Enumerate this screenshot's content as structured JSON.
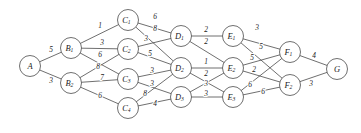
{
  "diagram": {
    "colors": {
      "background": "#ffffff",
      "stroke": "#4a4a4a",
      "text": "#1a1a1a"
    },
    "geometry": {
      "width": 361,
      "height": 133,
      "node_radius": 10.5
    }
  },
  "chart_data": {
    "type": "diagram",
    "layers": [
      [
        "A"
      ],
      [
        "B1",
        "B2"
      ],
      [
        "C1",
        "C2",
        "C3",
        "C4"
      ],
      [
        "D1",
        "D2",
        "D3"
      ],
      [
        "E1",
        "E2",
        "E3"
      ],
      [
        "F1",
        "F2"
      ],
      [
        "G"
      ]
    ],
    "nodes": [
      {
        "id": "A",
        "base": "A",
        "sub": "",
        "x": 30,
        "y": 66
      },
      {
        "id": "B1",
        "base": "B",
        "sub": "1",
        "x": 71,
        "y": 48
      },
      {
        "id": "B2",
        "base": "B",
        "sub": "2",
        "x": 71,
        "y": 83
      },
      {
        "id": "C1",
        "base": "C",
        "sub": "1",
        "x": 128,
        "y": 20
      },
      {
        "id": "C2",
        "base": "C",
        "sub": "2",
        "x": 128,
        "y": 49
      },
      {
        "id": "C3",
        "base": "C",
        "sub": "3",
        "x": 128,
        "y": 79
      },
      {
        "id": "C4",
        "base": "C",
        "sub": "4",
        "x": 128,
        "y": 108
      },
      {
        "id": "D1",
        "base": "D",
        "sub": "1",
        "x": 181,
        "y": 36
      },
      {
        "id": "D2",
        "base": "D",
        "sub": "2",
        "x": 181,
        "y": 68
      },
      {
        "id": "D3",
        "base": "D",
        "sub": "3",
        "x": 181,
        "y": 97
      },
      {
        "id": "E1",
        "base": "E",
        "sub": "1",
        "x": 233,
        "y": 36
      },
      {
        "id": "E2",
        "base": "E",
        "sub": "2",
        "x": 233,
        "y": 68
      },
      {
        "id": "E3",
        "base": "E",
        "sub": "3",
        "x": 233,
        "y": 97
      },
      {
        "id": "F1",
        "base": "F",
        "sub": "1",
        "x": 290,
        "y": 52
      },
      {
        "id": "F2",
        "base": "F",
        "sub": "2",
        "x": 290,
        "y": 85
      },
      {
        "id": "G",
        "base": "G",
        "sub": "",
        "x": 337,
        "y": 69
      }
    ],
    "edges": [
      {
        "from": "A",
        "to": "B1",
        "weight": 5,
        "lx": 51,
        "ly": 49
      },
      {
        "from": "A",
        "to": "B2",
        "weight": 3,
        "lx": 51,
        "ly": 80
      },
      {
        "from": "B1",
        "to": "C1",
        "weight": 1,
        "lx": 100,
        "ly": 25
      },
      {
        "from": "B1",
        "to": "C2",
        "weight": 3,
        "lx": 102,
        "ly": 42
      },
      {
        "from": "B1",
        "to": "C3",
        "weight": 6,
        "lx": 100,
        "ly": 54
      },
      {
        "from": "B2",
        "to": "C2",
        "weight": 8,
        "lx": 98,
        "ly": 66
      },
      {
        "from": "B2",
        "to": "C3",
        "weight": 7,
        "lx": 102,
        "ly": 77
      },
      {
        "from": "B2",
        "to": "C4",
        "weight": 6,
        "lx": 100,
        "ly": 95
      },
      {
        "from": "C1",
        "to": "D1",
        "weight": 6,
        "lx": 155,
        "ly": 16
      },
      {
        "from": "C1",
        "to": "D2",
        "weight": 8,
        "lx": 155,
        "ly": 28
      },
      {
        "from": "C2",
        "to": "D1",
        "weight": 3,
        "lx": 146,
        "ly": 38
      },
      {
        "from": "C2",
        "to": "D2",
        "weight": 5,
        "lx": 150,
        "ly": 53
      },
      {
        "from": "C3",
        "to": "D2",
        "weight": 3,
        "lx": 152,
        "ly": 70
      },
      {
        "from": "C3",
        "to": "D3",
        "weight": 3,
        "lx": 152,
        "ly": 83
      },
      {
        "from": "C4",
        "to": "D2",
        "weight": 8,
        "lx": 145,
        "ly": 93
      },
      {
        "from": "C4",
        "to": "D3",
        "weight": 4,
        "lx": 155,
        "ly": 103
      },
      {
        "from": "D1",
        "to": "E1",
        "weight": 2,
        "lx": 206,
        "ly": 29
      },
      {
        "from": "D1",
        "to": "E2",
        "weight": 2,
        "lx": 206,
        "ly": 41
      },
      {
        "from": "D2",
        "to": "E2",
        "weight": 1,
        "lx": 206,
        "ly": 61
      },
      {
        "from": "D2",
        "to": "E3",
        "weight": 2,
        "lx": 206,
        "ly": 73
      },
      {
        "from": "D3",
        "to": "E2",
        "weight": 3,
        "lx": 206,
        "ly": 83
      },
      {
        "from": "D3",
        "to": "E3",
        "weight": 3,
        "lx": 206,
        "ly": 93
      },
      {
        "from": "E1",
        "to": "F1",
        "weight": 3,
        "lx": 257,
        "ly": 27
      },
      {
        "from": "E1",
        "to": "F2",
        "weight": 5,
        "lx": 261,
        "ly": 46
      },
      {
        "from": "E2",
        "to": "F1",
        "weight": 5,
        "lx": 252,
        "ly": 57
      },
      {
        "from": "E2",
        "to": "F2",
        "weight": 2,
        "lx": 254,
        "ly": 69
      },
      {
        "from": "E3",
        "to": "F1",
        "weight": 6,
        "lx": 250,
        "ly": 84
      },
      {
        "from": "E3",
        "to": "F2",
        "weight": 6,
        "lx": 263,
        "ly": 91
      },
      {
        "from": "F1",
        "to": "G",
        "weight": 4,
        "lx": 314,
        "ly": 55
      },
      {
        "from": "F2",
        "to": "G",
        "weight": 3,
        "lx": 311,
        "ly": 83
      }
    ]
  }
}
